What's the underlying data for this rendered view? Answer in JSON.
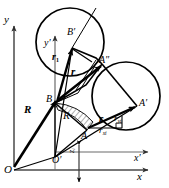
{
  "figure": {
    "background_color": "#ffffff",
    "stroke_color": "#000000",
    "axis_color": "#4a4a4a",
    "width": 169,
    "height": 188
  },
  "labels": {
    "y_axis": "y",
    "x_axis": "x",
    "y_prime_axis": "y′",
    "x_prime_axis": "x′",
    "origin_O": "O",
    "origin_O_prime": "O′",
    "point_A": "A",
    "point_A_prime": "A′",
    "point_A_double_prime": "A″",
    "point_B": "B",
    "point_B_prime": "B′",
    "vector_R_bold": "R",
    "scalar_R_italic": "R",
    "vector_r_bold_upper": "r",
    "vector_r_bold_lower": "r",
    "vector_r1_base": "r",
    "vector_r1_subscript": "1",
    "component_ryi_base": "r",
    "component_ryi_subscript": "yi",
    "component_rxi_base": "r",
    "component_rxi_subscript": "xi",
    "offset_zi_base": "z",
    "offset_zi_subscript": "i"
  },
  "geometry": {
    "circle_upper": {
      "cx": 70,
      "cy": 42,
      "r": 34
    },
    "circle_right": {
      "cx": 126,
      "cy": 96,
      "r": 34
    },
    "origin": {
      "x": 14,
      "y": 165
    },
    "origin_prime": {
      "x": 55,
      "y": 157
    },
    "point_A": {
      "x": 87,
      "y": 130
    },
    "point_A_prime": {
      "x": 137,
      "y": 106
    },
    "point_A_double_prime": {
      "x": 102,
      "y": 64
    },
    "point_B": {
      "x": 55,
      "y": 103
    },
    "point_B_prime": {
      "x": 72,
      "y": 48
    }
  },
  "annotations": {
    "hatched_sector": "hatched arc sector between B and A about origin-prime",
    "right_angle_marker": "right angle at component triangle of r"
  }
}
